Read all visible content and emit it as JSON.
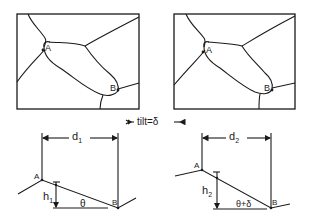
{
  "figure": {
    "panels": [
      {
        "id": "micrograph-before-tilt",
        "points": [
          {
            "label": "A"
          },
          {
            "label": "B"
          }
        ]
      },
      {
        "id": "micrograph-after-tilt",
        "points": [
          {
            "label": "A"
          },
          {
            "label": "B"
          }
        ]
      }
    ],
    "tilt_label": "tilt=δ",
    "profiles": [
      {
        "id": "profile-1",
        "point_a": "A",
        "point_b": "B",
        "distance": "d",
        "distance_sub": "1",
        "height": "h",
        "height_sub": "1",
        "angle": "θ"
      },
      {
        "id": "profile-2",
        "point_a": "A",
        "point_b": "B",
        "distance": "d",
        "distance_sub": "2",
        "height": "h",
        "height_sub": "2",
        "angle": "θ+δ"
      }
    ]
  }
}
